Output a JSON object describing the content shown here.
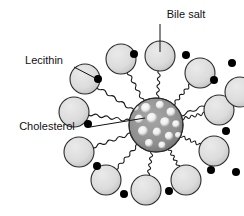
{
  "figure": {
    "type": "diagram",
    "background_color": "#ffffff",
    "width": 244,
    "height": 216
  },
  "labels": [
    {
      "id": "bile-salt",
      "text": "Bile salt",
      "text_x": 186,
      "text_y": 18,
      "anchor": "middle",
      "leader": "M 160 24 L 160 52",
      "points_to": "outer-head-circle"
    },
    {
      "id": "lecithin",
      "text": "Lecithin",
      "text_x": 44,
      "text_y": 64,
      "anchor": "middle",
      "leader": "M 74 67 L 97 79",
      "points_to": "black-dot"
    },
    {
      "id": "cholesterol",
      "text": "Cholesterol",
      "text_x": 47,
      "text_y": 130,
      "anchor": "middle",
      "leader": "M 90 127 L 145 118",
      "points_to": "core-sphere"
    }
  ],
  "core": {
    "name": "cholesterol-core",
    "cx": 156,
    "cy": 125,
    "r": 27,
    "base_color": "#8e8e8e",
    "speckle_color": "#ffffff",
    "outline_color": "#2b2b2b",
    "speckles": [
      {
        "cx": 146,
        "cy": 108,
        "r": 5.0
      },
      {
        "cx": 160,
        "cy": 105,
        "r": 4.2
      },
      {
        "cx": 171,
        "cy": 112,
        "r": 4.6
      },
      {
        "cx": 139,
        "cy": 119,
        "r": 4.4
      },
      {
        "cx": 152,
        "cy": 118,
        "r": 5.2
      },
      {
        "cx": 165,
        "cy": 122,
        "r": 4.8
      },
      {
        "cx": 176,
        "cy": 124,
        "r": 3.8
      },
      {
        "cx": 143,
        "cy": 131,
        "r": 5.0
      },
      {
        "cx": 157,
        "cy": 132,
        "r": 4.4
      },
      {
        "cx": 169,
        "cy": 136,
        "r": 4.2
      },
      {
        "cx": 149,
        "cy": 143,
        "r": 4.0
      },
      {
        "cx": 162,
        "cy": 145,
        "r": 3.6
      },
      {
        "cx": 136,
        "cy": 108,
        "r": 3.0
      },
      {
        "cx": 178,
        "cy": 135,
        "r": 3.0
      }
    ]
  },
  "heads": {
    "name": "bile-salt-heads",
    "fill": "#dcdcdc",
    "fill_shade": "#b9b9b9",
    "outline": "#2b2b2b",
    "radius": 15,
    "items": [
      {
        "cx": 160,
        "cy": 56,
        "angle": -90
      },
      {
        "cx": 200,
        "cy": 73,
        "angle": -50
      },
      {
        "cx": 219,
        "cy": 110,
        "angle": -12
      },
      {
        "cx": 214,
        "cy": 151,
        "angle": 25
      },
      {
        "cx": 186,
        "cy": 180,
        "angle": 62
      },
      {
        "cx": 146,
        "cy": 190,
        "angle": 92
      },
      {
        "cx": 106,
        "cy": 180,
        "angle": 122
      },
      {
        "cx": 79,
        "cy": 152,
        "angle": 155
      },
      {
        "cx": 74,
        "cy": 112,
        "angle": 190
      },
      {
        "cx": 85,
        "cy": 79,
        "angle": 222
      },
      {
        "cx": 121,
        "cy": 59,
        "angle": 254
      },
      {
        "cx": 240,
        "cy": 92,
        "angle": -30
      }
    ]
  },
  "tails": {
    "name": "lecithin-tails",
    "color": "#1a1a1a",
    "count": 12,
    "style": "wavy"
  },
  "dots": {
    "name": "cholesterol-dots",
    "fill": "#000000",
    "radius": 4,
    "items": [
      {
        "cx": 134,
        "cy": 54
      },
      {
        "cx": 186,
        "cy": 55
      },
      {
        "cx": 214,
        "cy": 80
      },
      {
        "cx": 226,
        "cy": 131
      },
      {
        "cx": 211,
        "cy": 170
      },
      {
        "cx": 169,
        "cy": 191
      },
      {
        "cx": 124,
        "cy": 194
      },
      {
        "cx": 97,
        "cy": 166
      },
      {
        "cx": 88,
        "cy": 124
      },
      {
        "cx": 98,
        "cy": 79
      },
      {
        "cx": 232,
        "cy": 63
      },
      {
        "cx": 236,
        "cy": 172
      }
    ]
  },
  "legend_keys": {
    "bile_salt": "Bile salt",
    "lecithin": "Lecithin",
    "cholesterol": "Cholesterol"
  }
}
